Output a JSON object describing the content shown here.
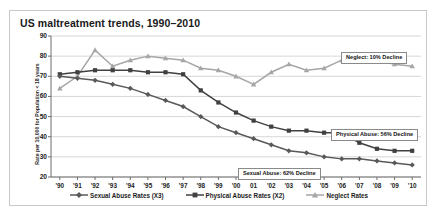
{
  "chart": {
    "title": "US maltreatment trends, 1990–2010",
    "ylabel": "Rate per 10,000 for Population < 18 years",
    "xlabel": "",
    "yticks": [
      "90",
      "80",
      "70",
      "60",
      "50",
      "40",
      "30",
      "20"
    ],
    "xticks": [
      "'90",
      "'91",
      "'92",
      "'93",
      "'94",
      "'95",
      "'96",
      "'97",
      "'98",
      "'99",
      "'00",
      "01",
      "'02",
      "'03",
      "'04",
      "'05",
      "'06",
      "'07",
      "'08",
      "'09",
      "'10"
    ],
    "legend": [
      {
        "label": "Sexual Abuse Rates (X3)",
        "marker": "diamond",
        "color": "#595959"
      },
      {
        "label": "Physical Abuse Rates (X2)",
        "marker": "square",
        "color": "#404040"
      },
      {
        "label": "Neglect Rates",
        "marker": "triangle",
        "color": "#a6a6a6"
      }
    ],
    "annotations": [
      {
        "name": "neglect-annotation",
        "text": "Neglect: 10% Decline",
        "x": 331,
        "y": 41
      },
      {
        "name": "physical-abuse-annotation",
        "text": "Physical Abuse: 56% Decline",
        "x": 321,
        "y": 118
      },
      {
        "name": "sexual-abuse-annotation",
        "text": "Sexual Abuse: 62% Decline",
        "x": 228,
        "y": 157
      }
    ]
  },
  "chart_data": {
    "type": "line",
    "title": "US maltreatment trends, 1990–2010",
    "xlabel": "",
    "ylabel": "Rate per 10,000 for Population < 18 years",
    "ylim": [
      20,
      90
    ],
    "grid": true,
    "legend_position": "bottom",
    "categories": [
      "'90",
      "'91",
      "'92",
      "'93",
      "'94",
      "'95",
      "'96",
      "'97",
      "'98",
      "'99",
      "'00",
      "01",
      "'02",
      "'03",
      "'04",
      "'05",
      "'06",
      "'07",
      "'08",
      "'09",
      "'10"
    ],
    "series": [
      {
        "name": "Sexual Abuse Rates (X3)",
        "marker": "diamond",
        "color": "#595959",
        "values": [
          70,
          69,
          68,
          66,
          64,
          61,
          58,
          55,
          50,
          45,
          42,
          39,
          36,
          33,
          32,
          30,
          29,
          29,
          28,
          27,
          26
        ]
      },
      {
        "name": "Physical Abuse Rates (X2)",
        "marker": "square",
        "color": "#404040",
        "values": [
          71,
          72,
          73,
          73,
          73,
          72,
          72,
          71,
          63,
          57,
          52,
          48,
          45,
          43,
          43,
          42,
          42,
          37,
          34,
          33,
          33
        ]
      },
      {
        "name": "Neglect Rates",
        "marker": "triangle",
        "color": "#a6a6a6",
        "values": [
          64,
          70,
          83,
          75,
          78,
          80,
          79,
          78,
          74,
          73,
          70,
          66,
          72,
          76,
          73,
          74,
          78,
          80,
          78,
          76,
          75
        ]
      }
    ],
    "annotations": [
      "Neglect: 10% Decline",
      "Physical Abuse: 56% Decline",
      "Sexual Abuse: 62% Decline"
    ]
  }
}
